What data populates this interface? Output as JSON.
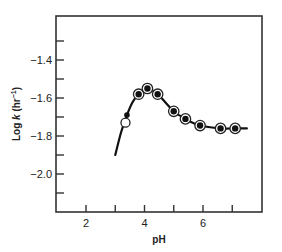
{
  "chart_data": {
    "type": "line",
    "title": "",
    "xlabel": "pH",
    "ylabel": "Log k (hr⁻¹)",
    "ylabel_parts": {
      "prefix": "Log ",
      "italic": "k",
      "suffix": " (hr",
      "sup": "−1",
      "close": ")"
    },
    "xlim": [
      1.0,
      8.1
    ],
    "ylim": [
      -2.2,
      -1.18
    ],
    "x_ticks": [
      2,
      3,
      4,
      5,
      6,
      7
    ],
    "x_tick_labels": [
      {
        "value": 2,
        "label": "2"
      },
      {
        "value": 4,
        "label": "4"
      },
      {
        "value": 6,
        "label": "6"
      }
    ],
    "y_ticks": [
      -1.3,
      -1.4,
      -1.5,
      -1.6,
      -1.7,
      -1.8,
      -1.9,
      -2.0,
      -2.1
    ],
    "y_tick_labels": [
      {
        "value": -1.4,
        "label": "−1.4"
      },
      {
        "value": -1.6,
        "label": "−1.6"
      },
      {
        "value": -1.8,
        "label": "−1.8"
      },
      {
        "value": -2.0,
        "label": "−2.0"
      }
    ],
    "grid": false,
    "series": [
      {
        "name": "fitted curve",
        "style": "line",
        "x": [
          3.0,
          3.2,
          3.4,
          3.6,
          3.8,
          4.1,
          4.45,
          5.0,
          5.4,
          5.9,
          6.6,
          7.1,
          7.5
        ],
        "y": [
          -1.9,
          -1.78,
          -1.69,
          -1.62,
          -1.58,
          -1.55,
          -1.58,
          -1.67,
          -1.71,
          -1.745,
          -1.76,
          -1.76,
          -1.76
        ]
      },
      {
        "name": "observed (ringed filled circles)",
        "style": "ringed-filled-circle",
        "x": [
          3.8,
          4.1,
          4.45,
          5.0,
          5.4,
          5.9,
          6.6,
          7.1
        ],
        "y": [
          -1.58,
          -1.55,
          -1.58,
          -1.67,
          -1.71,
          -1.745,
          -1.76,
          -1.76
        ]
      },
      {
        "name": "observed (small filled circle)",
        "style": "small-filled-circle",
        "x": [
          3.4
        ],
        "y": [
          -1.69
        ]
      },
      {
        "name": "observed (open circle)",
        "style": "open-circle",
        "x": [
          3.35
        ],
        "y": [
          -1.73
        ]
      }
    ]
  }
}
